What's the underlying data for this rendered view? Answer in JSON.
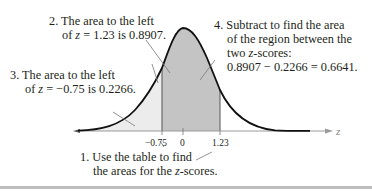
{
  "figure": {
    "colors": {
      "curve": "#111111",
      "between_shade": "#c4c4c4",
      "left_shade": "#ececec",
      "axis": "#9a9a9a",
      "leader": "#777777",
      "bottom_rule": "#bdbdbd"
    },
    "axis": {
      "variable": "z",
      "ticks": [
        "−0.75",
        "0",
        "1.23"
      ]
    },
    "callouts": {
      "c1": {
        "line1": "1. Use the table to find",
        "line2a": "the areas for the ",
        "line2_var": "z",
        "line2b": "-scores."
      },
      "c2": {
        "line1": "2. The area to the left",
        "line2a": "of ",
        "line2_var": "z",
        "line2b": " = 1.23 is 0.8907."
      },
      "c3": {
        "line1": "3. The area to the left",
        "line2a": "of ",
        "line2_var": "z",
        "line2b": " = −0.75 is 0.2266."
      },
      "c4": {
        "line1": "4. Subtract to find the area",
        "line2": "of the region between the",
        "line3a": "two ",
        "line3_var": "z",
        "line3b": "-scores:",
        "line4": "0.8907 − 0.2266 = 0.6641."
      }
    }
  }
}
